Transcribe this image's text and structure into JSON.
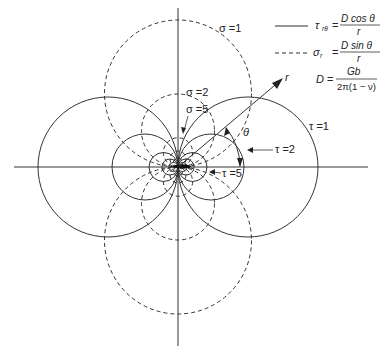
{
  "diagram": {
    "origin": {
      "x": 178,
      "y": 167
    },
    "axes": {
      "x_from": 14,
      "x_to": 368,
      "y_from": 8,
      "y_to": 346,
      "color": "#333333"
    },
    "solid_circles": [
      {
        "label": "τ = 1",
        "radius": 70
      },
      {
        "label": "τ = 2",
        "radius": 33
      },
      {
        "label": "τ = 5",
        "radius": 14.5
      },
      {
        "label": "",
        "radius": 8
      },
      {
        "label": "",
        "radius": 4.5
      }
    ],
    "dashed_circles": [
      {
        "label": "σ = 1",
        "radius": 73.5
      },
      {
        "label": "σ = 2",
        "radius": 36.5
      },
      {
        "label": "σ = 5",
        "radius": 14.6
      },
      {
        "label": "",
        "radius": 8
      },
      {
        "label": "",
        "radius": 4.5
      }
    ],
    "labels": {
      "sigma1": "σ =1",
      "sigma2": "σ =2",
      "sigma5": "σ =5",
      "tau1": "τ =1",
      "tau2": "τ =2",
      "tau5": "τ =5",
      "r": "r",
      "theta": "θ"
    },
    "legend": {
      "solid": {
        "lhs": "τ",
        "lhs_sub": "rθ",
        "numerator": "D cos θ",
        "denominator": "r"
      },
      "dashed": {
        "lhs": "σ",
        "lhs_sub": "r",
        "numerator": "D sin θ",
        "denominator": "r"
      },
      "constant": {
        "lhs": "D",
        "numerator": "Gb",
        "denominator": "2π(1 − ν)"
      }
    },
    "colors": {
      "line": "#333333",
      "background": "#ffffff"
    }
  }
}
